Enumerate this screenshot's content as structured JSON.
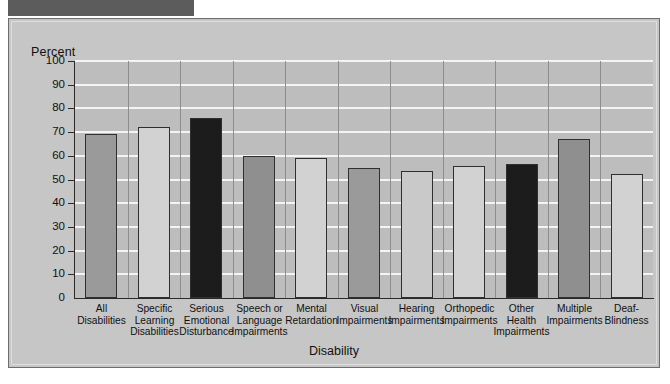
{
  "figure": {
    "header_block_label": "",
    "y_axis_title": "Percent",
    "x_axis_title": "Disability"
  },
  "colors": {
    "panel_background": "#c6c6c6",
    "plot_background": "#bdbdbd",
    "gridline": "#f4f4f4",
    "axis": "#2a2a2a",
    "bar_medium_gray": "#9a9a9a",
    "bar_light_gray": "#d2d2d2",
    "bar_dark": "#1c1c1c",
    "header_block": "#5c5c5c"
  },
  "chart_data": {
    "type": "bar",
    "title": "",
    "xlabel": "Disability",
    "ylabel": "Percent",
    "ylim": [
      0,
      100
    ],
    "yticks": [
      0,
      10,
      20,
      30,
      40,
      50,
      60,
      70,
      80,
      90,
      100
    ],
    "grid": true,
    "legend": null,
    "categories": [
      "All Disabilities",
      "Specific Learning Disabilities",
      "Serious Emotional Disturbance",
      "Speech or Language Impairments",
      "Mental Retardation",
      "Visual Impairments",
      "Hearing Impairments",
      "Orthopedic Impairments",
      "Other Health Impairments",
      "Multiple Impairments",
      "Deaf-Blindness"
    ],
    "category_lines": [
      [
        "All",
        "Disabilities"
      ],
      [
        "Specific",
        "Learning",
        "Disabilities"
      ],
      [
        "Serious",
        "Emotional",
        "Disturbance"
      ],
      [
        "Speech or",
        "Language",
        "Impairments"
      ],
      [
        "Mental",
        "Retardation"
      ],
      [
        "Visual",
        "Impairments"
      ],
      [
        "Hearing",
        "Impairments"
      ],
      [
        "Orthopedic",
        "Impairments"
      ],
      [
        "Other",
        "Health",
        "Impairments"
      ],
      [
        "Multiple",
        "Impairments"
      ],
      [
        "Deaf-",
        "Blindness"
      ]
    ],
    "values": [
      69,
      72,
      76,
      60,
      59,
      55,
      53.5,
      55.5,
      56.5,
      67,
      52.5
    ],
    "bar_colors": [
      "#9a9a9a",
      "#d2d2d2",
      "#1c1c1c",
      "#8f8f8f",
      "#d2d2d2",
      "#9a9a9a",
      "#c9c9c9",
      "#d2d2d2",
      "#1c1c1c",
      "#8f8f8f",
      "#d2d2d2"
    ]
  }
}
